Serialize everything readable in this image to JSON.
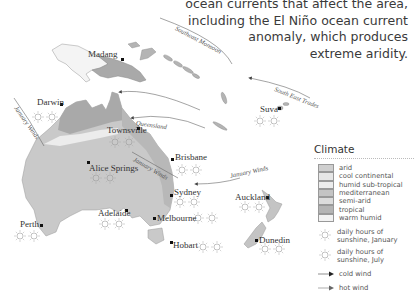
{
  "intro_text": {
    "lines": [
      "ocean currents that affect the area,",
      "including the El Niño ocean current",
      "anomaly, which produces",
      "extreme aridity."
    ]
  },
  "cities": [
    {
      "name": "Madang",
      "x": 123,
      "y": 60
    },
    {
      "name": "Darwin",
      "x": 61,
      "y": 104
    },
    {
      "name": "Townsville",
      "x": 137,
      "y": 129
    },
    {
      "name": "Alice Springs",
      "x": 88,
      "y": 162
    },
    {
      "name": "Brisbane",
      "x": 172,
      "y": 160
    },
    {
      "name": "Sydney",
      "x": 171,
      "y": 195
    },
    {
      "name": "Adelaide",
      "x": 126,
      "y": 211
    },
    {
      "name": "Melbourne",
      "x": 154,
      "y": 218
    },
    {
      "name": "Perth",
      "x": 41,
      "y": 225
    },
    {
      "name": "Hobart",
      "x": 171,
      "y": 243
    },
    {
      "name": "Suva",
      "x": 279,
      "y": 109
    },
    {
      "name": "Auckland",
      "x": 267,
      "y": 197
    },
    {
      "name": "Dunedin",
      "x": 256,
      "y": 240
    }
  ],
  "wind_labels": [
    {
      "text": "Southeast Monsoon"
    },
    {
      "text": "South East Trades"
    },
    {
      "text": "January Winds",
      "location": "northwest"
    },
    {
      "text": "Queensland"
    },
    {
      "text": "January Winds",
      "location": "inland"
    },
    {
      "text": "January Winds",
      "location": "tasman"
    }
  ],
  "legend": {
    "title": "Climate",
    "climate_types": [
      {
        "label": "arid",
        "color": "#cfcfcf"
      },
      {
        "label": "cool continental",
        "color": "#e6e6e6"
      },
      {
        "label": "humid sub-tropical",
        "color": "#ececec"
      },
      {
        "label": "mediterranean",
        "color": "#c4c4c4"
      },
      {
        "label": "semi-arid",
        "color": "#dcdcdc"
      },
      {
        "label": "tropical",
        "color": "#b4b4b4"
      },
      {
        "label": "warm humid",
        "color": "#f2f2f2"
      }
    ],
    "symbols": [
      {
        "icon": "sun-icon-january",
        "label": "daily hours of sunshine, January"
      },
      {
        "icon": "sun-icon-july",
        "label": "daily hours of sunshine, July"
      }
    ],
    "winds": [
      {
        "icon": "cold-wind-arrow-icon",
        "label": "cold wind"
      },
      {
        "icon": "hot-wind-arrow-icon",
        "label": "hot wind"
      }
    ]
  },
  "colors": {
    "land_arid": "#c9c9c9",
    "land_tropical": "#a9a9a9",
    "land_light": "#e8e8e8",
    "pale_band": "#ececec",
    "ocean": "#ffffff",
    "text": "#333333"
  }
}
